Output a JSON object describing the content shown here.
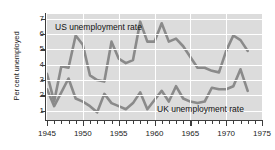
{
  "figure": {
    "background_color": "#ffffff",
    "plot_background_color": "#dcdcdc",
    "gridline_color": "#ffffff",
    "axis_color": "#3d3d3d",
    "line_color": "#8a8a8a"
  },
  "axes": {
    "ylabel": "Per cent unemployed",
    "ytick_labels": [
      "1",
      "2",
      "3",
      "4",
      "5",
      "6",
      "7"
    ],
    "xtick_labels": [
      "1945",
      "1950",
      "1955",
      "1960",
      "1965",
      "1970",
      "1975"
    ]
  },
  "labels": {
    "us_series": "US unemployment rate",
    "uk_series": "UK unemployment rate"
  },
  "chart_data": {
    "type": "line",
    "title": "",
    "xlabel": "",
    "ylabel": "Per cent unemployed",
    "xlim": [
      1945,
      1975
    ],
    "ylim": [
      0.4,
      7.3
    ],
    "grid": true,
    "legend_position": "inline-annotation",
    "x": [
      1945,
      1946,
      1947,
      1948,
      1949,
      1950,
      1951,
      1952,
      1953,
      1954,
      1955,
      1956,
      1957,
      1958,
      1959,
      1960,
      1961,
      1962,
      1963,
      1964,
      1965,
      1966,
      1967,
      1968,
      1969,
      1970,
      1971,
      1972,
      1973
    ],
    "series": [
      {
        "name": "US unemployment rate",
        "values": [
          3.4,
          1.6,
          3.9,
          3.8,
          5.9,
          5.3,
          3.3,
          3.0,
          2.9,
          5.5,
          4.4,
          4.1,
          4.3,
          6.8,
          5.5,
          5.5,
          6.7,
          5.5,
          5.7,
          5.2,
          4.5,
          3.8,
          3.8,
          3.6,
          3.5,
          4.9,
          5.9,
          5.6,
          4.9
        ],
        "style": "solid",
        "color": "#8a8a8a"
      },
      {
        "name": "UK unemployment rate",
        "values": [
          2.4,
          1.3,
          2.2,
          3.1,
          1.8,
          1.6,
          1.3,
          0.9,
          2.1,
          1.5,
          1.3,
          1.1,
          1.5,
          2.2,
          1.1,
          1.7,
          2.3,
          1.6,
          2.6,
          1.8,
          1.6,
          1.5,
          1.6,
          2.5,
          2.4,
          2.4,
          2.6,
          3.7,
          2.3
        ],
        "style": "solid",
        "color": "#8a8a8a"
      }
    ]
  }
}
